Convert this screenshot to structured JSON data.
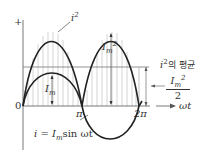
{
  "diagram": {
    "axis": {
      "plus_label": "+",
      "origin_label": "0",
      "pi_label": "π",
      "two_pi_label": "2π",
      "x_label": "ωt"
    },
    "curves": {
      "i_squared_label": "i",
      "i_squared_sup": "2",
      "current_eq_prefix": "i = I",
      "current_eq_sub": "m",
      "current_eq_suffix": "sin ωt"
    },
    "annotations": {
      "im_label": "I",
      "im_sub": "m",
      "im2_label": "I",
      "im2_sub": "m",
      "im2_sup": "2",
      "average_label_i": "i",
      "average_label_sup": "2",
      "average_label_text": "의 평균",
      "half_num_main": "I",
      "half_num_sub": "m",
      "half_num_sup": "2",
      "half_den": "2"
    },
    "colors": {
      "curve": "#222222",
      "axis": "#555555",
      "hatch": "#9a9a9a",
      "average": "#777777"
    }
  }
}
